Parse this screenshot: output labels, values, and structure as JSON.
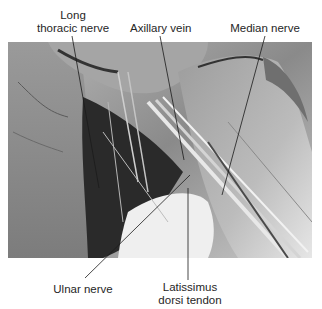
{
  "figure": {
    "type": "labeled anatomical dissection photograph (grayscale)"
  },
  "labels": {
    "long_thoracic_nerve": {
      "line1": "Long",
      "line2": "thoracic nerve"
    },
    "axillary_vein": "Axillary vein",
    "median_nerve": "Median nerve",
    "ulnar_nerve": "Ulnar nerve",
    "latissimus_dorsi_tendon": {
      "line1": "Latissimus",
      "line2": "dorsi tendon"
    }
  },
  "colors": {
    "background": "#ffffff",
    "label_text": "#262626",
    "leader_line": "#1a1a1a"
  }
}
